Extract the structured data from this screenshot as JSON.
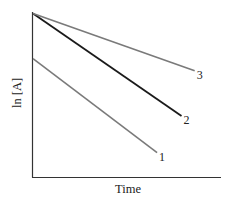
{
  "chart_data": {
    "type": "line",
    "title": "",
    "xlabel": "Time",
    "ylabel": "ln [A]",
    "grid": false,
    "legend": "inline line labels at line ends",
    "x_ticks": [],
    "y_ticks": [],
    "xlim": [
      0,
      1
    ],
    "ylim": [
      0,
      1
    ],
    "series": [
      {
        "name": "1",
        "label": "1",
        "color": "#7a7a7a",
        "x": [
          0,
          0.66
        ],
        "y": [
          0.68,
          0.14
        ]
      },
      {
        "name": "2",
        "label": "2",
        "color": "#1a1a1a",
        "x": [
          0,
          0.79
        ],
        "y": [
          0.94,
          0.35
        ]
      },
      {
        "name": "3",
        "label": "3",
        "color": "#7a7a7a",
        "x": [
          0,
          0.86
        ],
        "y": [
          0.94,
          0.61
        ]
      }
    ]
  },
  "axes": {
    "color": "#333333"
  }
}
